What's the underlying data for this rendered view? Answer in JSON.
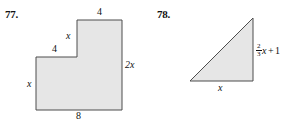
{
  "page": {
    "background_color": "#ffffff",
    "figure_fill": "#e6e6e6",
    "figure_stroke": "#4d4d4d"
  },
  "problems": [
    {
      "number": "77.",
      "shape": "l-shaped-polygon",
      "labels": {
        "top": "4",
        "inner_vertical": "x",
        "middle_horizontal": "4",
        "left_vertical": "x",
        "right_vertical": "2x",
        "bottom": "8"
      }
    },
    {
      "number": "78.",
      "shape": "right-triangle",
      "labels": {
        "base": "x",
        "height_fraction_numerator": "2",
        "height_fraction_denominator": "3",
        "height_variable": "x",
        "height_operator": "+",
        "height_constant": "1"
      }
    }
  ]
}
